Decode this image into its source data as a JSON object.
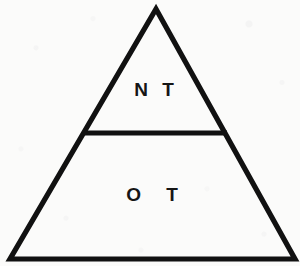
{
  "diagram": {
    "name": "two-tier-pyramid",
    "type": "pyramid",
    "title": "",
    "background_color": "#fbfbfa",
    "stroke_color": "#111111",
    "text_color": "#151515",
    "stroke_width": 5,
    "apex": {
      "x": 156,
      "y": 9
    },
    "base_left": {
      "x": 10,
      "y": 259
    },
    "base_right": {
      "x": 295,
      "y": 259
    },
    "divider": {
      "name": "tier-divider",
      "y": 133,
      "x_start": 85,
      "x_end": 227
    },
    "tiers": [
      {
        "name": "upper-tier",
        "label": "N T",
        "position": "top",
        "center": {
          "x": 154,
          "y": 89
        }
      },
      {
        "name": "lower-tier",
        "label": "O T",
        "position": "bottom",
        "center": {
          "x": 152,
          "y": 194
        }
      }
    ]
  }
}
